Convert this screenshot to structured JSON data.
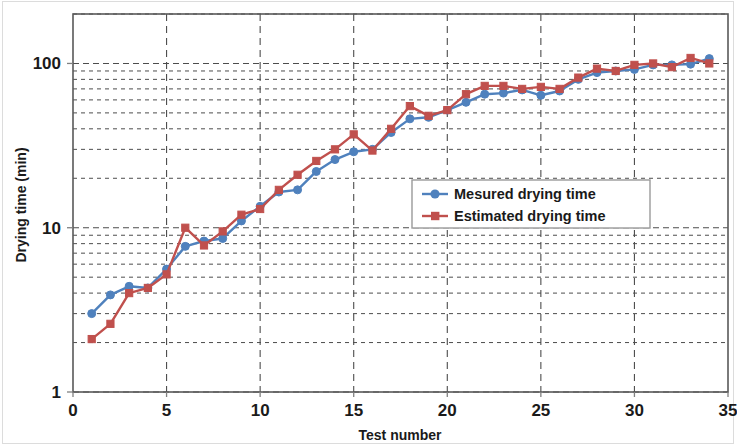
{
  "chart_data": {
    "type": "line",
    "title": "",
    "xlabel": "Test number",
    "ylabel": "Drying time (min)",
    "yscale": "log",
    "xlim": [
      0,
      35
    ],
    "ylim": [
      1,
      200
    ],
    "xticks": [
      0,
      5,
      10,
      15,
      20,
      25,
      30,
      35
    ],
    "yticks": [
      1,
      10,
      100
    ],
    "ytick_labels": [
      "1",
      "10",
      "100"
    ],
    "grid": "dashed minor+major horizontal, dashed major vertical",
    "legend_position": "center-right inside plot",
    "x": [
      1,
      2,
      3,
      4,
      5,
      6,
      7,
      8,
      9,
      10,
      11,
      12,
      13,
      14,
      15,
      16,
      17,
      18,
      19,
      20,
      21,
      22,
      23,
      24,
      25,
      26,
      27,
      28,
      29,
      30,
      31,
      32,
      33,
      34
    ],
    "series": [
      {
        "name": "Mesured drying time",
        "color": "#4F81BD",
        "marker": "diamond",
        "values": [
          3.0,
          3.9,
          4.4,
          4.3,
          5.6,
          7.7,
          8.3,
          8.6,
          11.0,
          13.5,
          16.5,
          17.0,
          22.0,
          26.0,
          29.0,
          30.0,
          38.0,
          46.0,
          47.0,
          52.0,
          58.0,
          65.0,
          66.0,
          69.0,
          64.0,
          68.0,
          80.0,
          88.0,
          90.0,
          92.0,
          98.0,
          98.0,
          99.0,
          107.0
        ]
      },
      {
        "name": "Estimated drying time",
        "color": "#C0504D",
        "marker": "square",
        "values": [
          2.1,
          2.6,
          4.0,
          4.3,
          5.2,
          10.0,
          7.8,
          9.5,
          12.0,
          13.0,
          17.0,
          21.0,
          25.5,
          30.0,
          37.0,
          29.5,
          40.0,
          55.0,
          48.0,
          52.0,
          65.0,
          73.0,
          73.0,
          70.0,
          72.0,
          70.0,
          82.0,
          93.0,
          90.0,
          98.0,
          100.0,
          95.0,
          108.0,
          100.0
        ]
      }
    ]
  },
  "axes": {
    "x_title": "Test number",
    "y_title": "Drying time (min)",
    "x_tick_labels": [
      "0",
      "5",
      "10",
      "15",
      "20",
      "25",
      "30",
      "35"
    ],
    "y_tick_labels": [
      "100",
      "10",
      "1"
    ]
  },
  "legend": {
    "entries": [
      {
        "label": "Mesured drying time",
        "color": "#4F81BD",
        "marker": "diamond"
      },
      {
        "label": "Estimated drying time",
        "color": "#C0504D",
        "marker": "square"
      }
    ]
  },
  "colors": {
    "measured": "#4F81BD",
    "estimated": "#C0504D",
    "grid": "#4d4d4d",
    "axis": "#808080",
    "text": "#1a1a1a"
  }
}
